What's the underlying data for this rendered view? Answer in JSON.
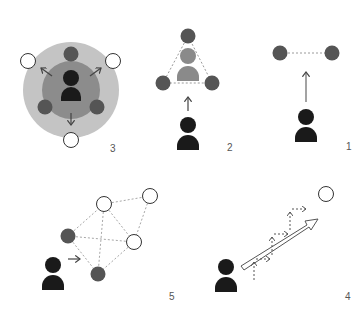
{
  "colors": {
    "person": "#1a1a1a",
    "person_faded": "#8a8a8a",
    "node_filled": "#555555",
    "node_empty_fill": "#ffffff",
    "node_empty_stroke": "#333333",
    "outer_ring": "#c4c4c4",
    "inner_ring": "#8c8c8c",
    "dashed_line": "#9a9a9a",
    "arrow": "#444444",
    "label": "#555555"
  },
  "panels": [
    {
      "id": "panel-1",
      "label": "1",
      "description": "Person moves toward two connected filled nodes"
    },
    {
      "id": "panel-2",
      "label": "2",
      "description": "Person moves toward triangle of three filled nodes enclosing a faded person"
    },
    {
      "id": "panel-3",
      "label": "3",
      "description": "Person at center of two concentric circles surrounded by filled nodes, with arrows pointing out to empty nodes"
    },
    {
      "id": "panel-4",
      "label": "4",
      "description": "Person with a long arrow toward an empty node, accompanied by stepwise dashed arrows"
    },
    {
      "id": "panel-5",
      "label": "5",
      "description": "Person enters a dashed-line network of filled and empty nodes"
    }
  ]
}
